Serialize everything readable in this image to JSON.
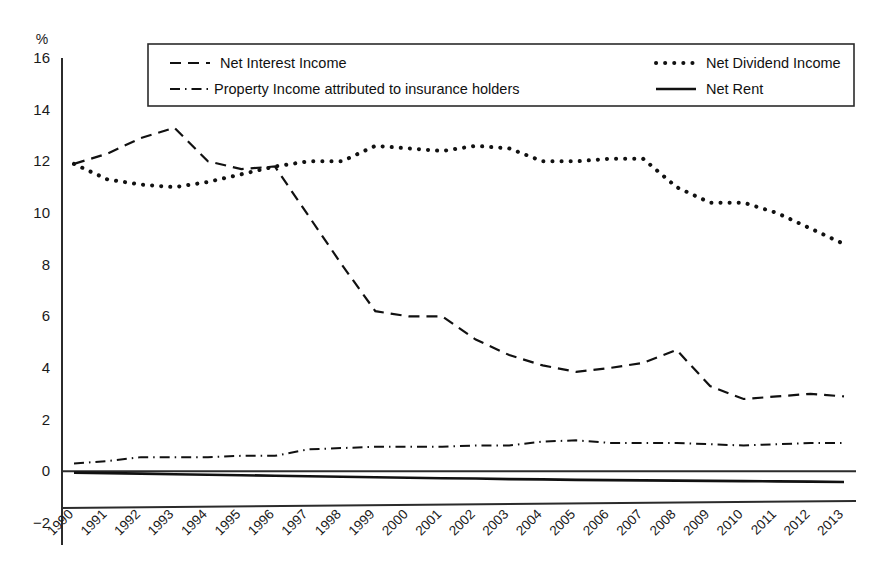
{
  "chart_data": {
    "type": "line",
    "title": "",
    "xlabel": "",
    "ylabel": "%",
    "ylim": [
      -2,
      16
    ],
    "ytick_step": 2,
    "yticks": [
      "16",
      "14",
      "12",
      "10",
      "8",
      "6",
      "4",
      "2",
      "0",
      "-2"
    ],
    "grid": false,
    "legend_position": "top-inside",
    "categories": [
      "1990",
      "1991",
      "1992",
      "1993",
      "1994",
      "1995",
      "1996",
      "1997",
      "1998",
      "1999",
      "2000",
      "2001",
      "2002",
      "2003",
      "2004",
      "2005",
      "2006",
      "2007",
      "2008",
      "2009",
      "2010",
      "2011",
      "2012",
      "2013"
    ],
    "series": [
      {
        "name": "Net Interest Income",
        "style": "dashed",
        "color": "#111111",
        "values": [
          11.9,
          12.3,
          12.9,
          13.3,
          12.0,
          11.7,
          11.8,
          9.9,
          8.0,
          6.2,
          6.0,
          6.0,
          5.1,
          4.5,
          4.1,
          3.85,
          4.0,
          4.2,
          4.7,
          3.3,
          2.8,
          2.9,
          3.0,
          2.9
        ]
      },
      {
        "name": "Net Dividend Income",
        "style": "dotted",
        "color": "#111111",
        "values": [
          11.9,
          11.3,
          11.1,
          11.0,
          11.2,
          11.5,
          11.8,
          12.0,
          12.0,
          12.6,
          12.5,
          12.4,
          12.6,
          12.5,
          12.0,
          12.0,
          12.1,
          12.1,
          11.0,
          10.4,
          10.4,
          10.0,
          9.4,
          8.8
        ]
      },
      {
        "name": "Property Income attributed to insurance holders",
        "style": "dash-dot",
        "color": "#111111",
        "values": [
          0.3,
          0.4,
          0.55,
          0.55,
          0.55,
          0.6,
          0.6,
          0.85,
          0.9,
          0.95,
          0.95,
          0.95,
          1.0,
          1.0,
          1.15,
          1.2,
          1.1,
          1.1,
          1.1,
          1.05,
          1.0,
          1.05,
          1.1,
          1.1
        ]
      },
      {
        "name": "Net Rent",
        "style": "solid",
        "color": "#2b2b2b",
        "values": [
          -0.05,
          -0.07,
          -0.09,
          -0.11,
          -0.13,
          -0.15,
          -0.17,
          -0.19,
          -0.21,
          -0.23,
          -0.25,
          -0.27,
          -0.28,
          -0.3,
          -0.31,
          -0.33,
          -0.34,
          -0.35,
          -0.36,
          -0.37,
          -0.38,
          -0.39,
          -0.4,
          -0.41
        ]
      }
    ]
  },
  "axis": {
    "unit_label": "%"
  },
  "legend": {
    "entries": [
      {
        "label": "Net Interest Income",
        "style": "dashed"
      },
      {
        "label": "Net Dividend Income",
        "style": "dotted"
      },
      {
        "label": "Property Income attributed to insurance holders",
        "style": "dash-dot"
      },
      {
        "label": "Net Rent",
        "style": "solid"
      }
    ]
  }
}
